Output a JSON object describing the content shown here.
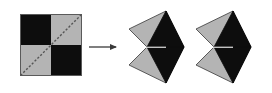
{
  "figure": {
    "title": "Checkerboard square dissected along its diagonal into two chevron pieces",
    "background_color": "#ffffff",
    "width": 272,
    "height": 93,
    "colors": {
      "black": "#0d0d0d",
      "gray": "#b4b4b4",
      "outline": "#4a4a4a",
      "dashed_diagonal": "#555555",
      "arrow": "#3a3a3a",
      "background": "#ffffff"
    },
    "panels": [
      {
        "name": "source-square",
        "label": "checkerboard square",
        "x": 20,
        "y": 14,
        "size": 61,
        "quadrants": [
          {
            "position": "top-left",
            "fill": "black"
          },
          {
            "position": "top-right",
            "fill": "gray"
          },
          {
            "position": "bottom-left",
            "fill": "gray"
          },
          {
            "position": "bottom-right",
            "fill": "black"
          }
        ],
        "diagonal": {
          "style": "dashed",
          "from": "bottom-left",
          "to": "top-right"
        }
      },
      {
        "name": "transform-arrow",
        "label": "transforms into",
        "glyph": "right-arrow",
        "x1": 89,
        "x2": 118,
        "y": 47
      },
      {
        "name": "result-chevron-1",
        "label": "chevron piece 1",
        "x": 129,
        "y": 11,
        "width": 55,
        "height": 72,
        "parts": [
          {
            "name": "upper-wing",
            "fill": "gray"
          },
          {
            "name": "upper-blade",
            "fill": "black"
          },
          {
            "name": "lower-wing",
            "fill": "gray"
          },
          {
            "name": "lower-blade",
            "fill": "black"
          }
        ]
      },
      {
        "name": "result-chevron-2",
        "label": "chevron piece 2",
        "x": 196,
        "y": 11,
        "width": 55,
        "height": 72,
        "parts": [
          {
            "name": "upper-wing",
            "fill": "gray"
          },
          {
            "name": "upper-blade",
            "fill": "black"
          },
          {
            "name": "lower-wing",
            "fill": "gray"
          },
          {
            "name": "lower-blade",
            "fill": "black"
          }
        ]
      }
    ]
  }
}
